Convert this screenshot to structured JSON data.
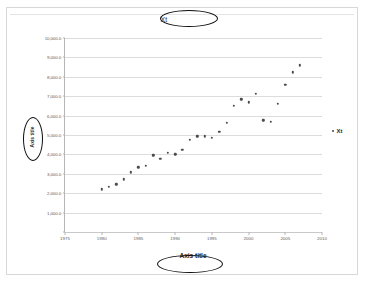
{
  "document": {
    "background_color": "#ffffff",
    "frame_color": "#d8d8d8"
  },
  "chart": {
    "title": "Xt",
    "xaxis_title": "Axis title",
    "yaxis_title": "Axis title",
    "legend": {
      "label": "Xt",
      "marker_icon": "scatter-dot-marker",
      "position": "right"
    },
    "marker_color": "#4a4a4a",
    "gridline_color": "#dcdcdc"
  },
  "annotations": [
    {
      "name": "title-ellipse",
      "shape": "ellipse",
      "target": "Xt",
      "color": "#0d0d0d"
    },
    {
      "name": "xtitle-ellipse",
      "shape": "ellipse",
      "target": "Axis title",
      "color": "#0d0d0d"
    },
    {
      "name": "ytitle-ellipse",
      "shape": "ellipse",
      "target": "Axis title",
      "color": "#0d0d0d"
    }
  ],
  "chart_data": {
    "type": "scatter",
    "title": "Xt",
    "xlabel": "Axis title",
    "ylabel": "Axis title",
    "xlim": [
      1975,
      2010
    ],
    "ylim": [
      0,
      10000
    ],
    "grid": true,
    "legend_position": "right",
    "xticks": [
      1975,
      1980,
      1985,
      1990,
      1995,
      2000,
      2005,
      2010
    ],
    "xtick_labels": [
      "1975",
      "1980",
      "1985",
      "1990",
      "1995",
      "2000",
      "2005",
      "2010"
    ],
    "yticks": [
      1000,
      2000,
      3000,
      4000,
      5000,
      6000,
      7000,
      8000,
      9000,
      10000
    ],
    "ytick_labels": [
      "1,000.0",
      "2,000.0",
      "3,000.0",
      "4,000.0",
      "5,000.0",
      "6,000.0",
      "7,000.0",
      "8,000.0",
      "9,000.0",
      "10,000.0"
    ],
    "series": [
      {
        "name": "Xt",
        "marker": "dot",
        "color": "#4a4a4a",
        "x": [
          1980,
          1981,
          1982,
          1983,
          1984,
          1985,
          1986,
          1987,
          1988,
          1989,
          1990,
          1991,
          1992,
          1993,
          1994,
          1995,
          1996,
          1997,
          1998,
          1999,
          2000,
          2001,
          2002,
          2003,
          2004,
          2005,
          2006,
          2007
        ],
        "y": [
          2200,
          2330,
          2460,
          2720,
          3080,
          3340,
          3420,
          3960,
          3760,
          4080,
          4010,
          4240,
          4760,
          4940,
          4930,
          4870,
          5150,
          5620,
          6500,
          6830,
          6690,
          7130,
          5750,
          5670,
          6600,
          7590,
          8230,
          8590
        ]
      }
    ]
  }
}
